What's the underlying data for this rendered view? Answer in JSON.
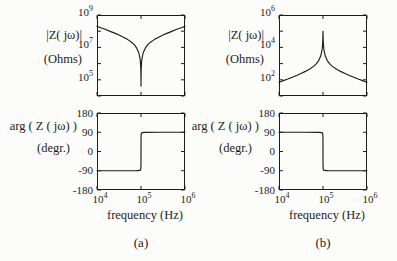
{
  "figure": {
    "mag_ylabel": "|Z( jω)|",
    "mag_units": "(Ohms)",
    "phase_ylabel": "arg ( Z ( jω) )",
    "phase_units": "(degr.)",
    "x_axis_label": "frequency (Hz)",
    "caption_a": "(a)",
    "caption_b": "(b)",
    "ink_color": "#1c1c1c",
    "background_color": "#fcfcfb"
  },
  "chart_data": [
    {
      "id": "impedance-magnitude-a",
      "type": "line",
      "xscale": "log",
      "yscale": "log",
      "xlabel": "frequency (Hz)",
      "ylabel": "|Z( jω)| (Ohms)",
      "x_units": "log10(Hz)",
      "y_units": "log10(Ohms)",
      "x_range": [
        4,
        6
      ],
      "y_range": [
        4,
        9
      ],
      "x_ticks": [
        4,
        5,
        6
      ],
      "y_ticks": [
        4,
        5,
        6,
        7,
        8,
        9
      ],
      "y_tick_labels": [
        {
          "at": 9,
          "text": "10^9"
        },
        {
          "at": 7,
          "text": "10^7"
        },
        {
          "at": 5,
          "text": "10^5"
        }
      ],
      "x_tick_labels": [],
      "resonance_hz": 100000,
      "points": [
        [
          4.0,
          8.3
        ],
        [
          4.1,
          8.2
        ],
        [
          4.2,
          8.1
        ],
        [
          4.3,
          7.99
        ],
        [
          4.4,
          7.88
        ],
        [
          4.5,
          7.76
        ],
        [
          4.6,
          7.63
        ],
        [
          4.7,
          7.48
        ],
        [
          4.8,
          7.29
        ],
        [
          4.85,
          7.15
        ],
        [
          4.9,
          6.97
        ],
        [
          4.95,
          6.67
        ],
        [
          4.98,
          6.27
        ],
        [
          4.99,
          5.97
        ],
        [
          4.995,
          5.67
        ],
        [
          4.998,
          5.28
        ],
        [
          4.999,
          5.01
        ],
        [
          5.0,
          4.6
        ],
        [
          5.001,
          5.01
        ],
        [
          5.002,
          5.28
        ],
        [
          5.005,
          5.67
        ],
        [
          5.01,
          5.97
        ],
        [
          5.02,
          6.27
        ],
        [
          5.05,
          6.67
        ],
        [
          5.1,
          6.97
        ],
        [
          5.15,
          7.15
        ],
        [
          5.2,
          7.29
        ],
        [
          5.3,
          7.48
        ],
        [
          5.4,
          7.63
        ],
        [
          5.5,
          7.76
        ],
        [
          5.6,
          7.88
        ],
        [
          5.7,
          7.99
        ],
        [
          5.8,
          8.1
        ],
        [
          5.9,
          8.2
        ],
        [
          6.0,
          8.3
        ]
      ]
    },
    {
      "id": "impedance-magnitude-b",
      "type": "line",
      "xscale": "log",
      "yscale": "log",
      "xlabel": "frequency (Hz)",
      "ylabel": "|Z( jω)| (Ohms)",
      "x_units": "log10(Hz)",
      "y_units": "log10(Ohms)",
      "x_range": [
        4,
        6
      ],
      "y_range": [
        1,
        6
      ],
      "x_ticks": [
        4,
        5,
        6
      ],
      "y_ticks": [
        1,
        2,
        3,
        4,
        5,
        6
      ],
      "y_tick_labels": [
        {
          "at": 6,
          "text": "10^6"
        },
        {
          "at": 4,
          "text": "10^4"
        },
        {
          "at": 2,
          "text": "10^2"
        }
      ],
      "x_tick_labels": [],
      "resonance_hz": 100000,
      "points": [
        [
          4.0,
          1.85
        ],
        [
          4.1,
          1.95
        ],
        [
          4.2,
          2.05
        ],
        [
          4.3,
          2.16
        ],
        [
          4.4,
          2.27
        ],
        [
          4.5,
          2.39
        ],
        [
          4.6,
          2.52
        ],
        [
          4.7,
          2.67
        ],
        [
          4.8,
          2.86
        ],
        [
          4.85,
          3.0
        ],
        [
          4.9,
          3.17
        ],
        [
          4.95,
          3.48
        ],
        [
          4.98,
          3.87
        ],
        [
          4.99,
          4.17
        ],
        [
          4.995,
          4.46
        ],
        [
          4.998,
          4.75
        ],
        [
          4.999,
          4.9
        ],
        [
          5.0,
          5.0
        ],
        [
          5.001,
          4.9
        ],
        [
          5.002,
          4.75
        ],
        [
          5.005,
          4.46
        ],
        [
          5.01,
          4.17
        ],
        [
          5.02,
          3.87
        ],
        [
          5.05,
          3.48
        ],
        [
          5.1,
          3.17
        ],
        [
          5.15,
          3.0
        ],
        [
          5.2,
          2.86
        ],
        [
          5.3,
          2.67
        ],
        [
          5.4,
          2.52
        ],
        [
          5.5,
          2.39
        ],
        [
          5.6,
          2.27
        ],
        [
          5.7,
          2.16
        ],
        [
          5.8,
          2.05
        ],
        [
          5.9,
          1.95
        ],
        [
          6.0,
          1.85
        ]
      ]
    },
    {
      "id": "impedance-phase-a",
      "type": "line",
      "xscale": "log",
      "yscale": "linear",
      "xlabel": "frequency (Hz)",
      "ylabel": "arg ( Z ( jω) ) (degr.)",
      "x_units": "log10(Hz)",
      "y_units": "degrees",
      "x_range": [
        4,
        6
      ],
      "y_range": [
        -180,
        180
      ],
      "x_ticks": [
        4,
        5,
        6
      ],
      "y_ticks": [
        -180,
        -90,
        0,
        90,
        180
      ],
      "y_tick_labels": [
        {
          "at": 180,
          "text": "180"
        },
        {
          "at": 90,
          "text": "90"
        },
        {
          "at": 0,
          "text": "0"
        },
        {
          "at": -90,
          "text": "-90"
        },
        {
          "at": -180,
          "text": "-180"
        }
      ],
      "x_tick_labels": [
        {
          "at": 4,
          "text": "10^4"
        },
        {
          "at": 5,
          "text": "10^5"
        },
        {
          "at": 6,
          "text": "10^6"
        }
      ],
      "resonance_hz": 100000,
      "points": [
        [
          4.0,
          -90
        ],
        [
          4.6,
          -90
        ],
        [
          4.9,
          -89.5
        ],
        [
          4.97,
          -88.5
        ],
        [
          4.99,
          -86
        ],
        [
          4.995,
          -82
        ],
        [
          4.998,
          -72
        ],
        [
          4.999,
          -60
        ],
        [
          4.9995,
          -45
        ],
        [
          5.0,
          0
        ],
        [
          5.0005,
          45
        ],
        [
          5.001,
          60
        ],
        [
          5.002,
          72
        ],
        [
          5.005,
          82
        ],
        [
          5.01,
          86
        ],
        [
          5.03,
          88.5
        ],
        [
          5.1,
          89.5
        ],
        [
          5.4,
          90
        ],
        [
          6.0,
          90
        ]
      ]
    },
    {
      "id": "impedance-phase-b",
      "type": "line",
      "xscale": "log",
      "yscale": "linear",
      "xlabel": "frequency (Hz)",
      "ylabel": "arg ( Z ( jω) ) (degr.)",
      "x_units": "log10(Hz)",
      "y_units": "degrees",
      "x_range": [
        4,
        6
      ],
      "y_range": [
        -180,
        180
      ],
      "x_ticks": [
        4,
        5,
        6
      ],
      "y_ticks": [
        -180,
        -90,
        0,
        90,
        180
      ],
      "y_tick_labels": [
        {
          "at": 180,
          "text": "180"
        },
        {
          "at": 90,
          "text": "90"
        },
        {
          "at": 0,
          "text": "0"
        },
        {
          "at": -90,
          "text": "-90"
        },
        {
          "at": -180,
          "text": "-180"
        }
      ],
      "x_tick_labels": [
        {
          "at": 4,
          "text": "10^4"
        },
        {
          "at": 5,
          "text": "10^5"
        },
        {
          "at": 6,
          "text": "10^6"
        }
      ],
      "resonance_hz": 100000,
      "points": [
        [
          4.0,
          90
        ],
        [
          4.6,
          90
        ],
        [
          4.9,
          89.5
        ],
        [
          4.97,
          88.5
        ],
        [
          4.99,
          86
        ],
        [
          4.995,
          82
        ],
        [
          4.998,
          72
        ],
        [
          4.999,
          60
        ],
        [
          4.9995,
          45
        ],
        [
          5.0,
          0
        ],
        [
          5.0005,
          -45
        ],
        [
          5.001,
          -60
        ],
        [
          5.002,
          -72
        ],
        [
          5.005,
          -82
        ],
        [
          5.01,
          -86
        ],
        [
          5.03,
          -88.5
        ],
        [
          5.1,
          -89.5
        ],
        [
          5.4,
          -90
        ],
        [
          6.0,
          -90
        ]
      ]
    }
  ]
}
